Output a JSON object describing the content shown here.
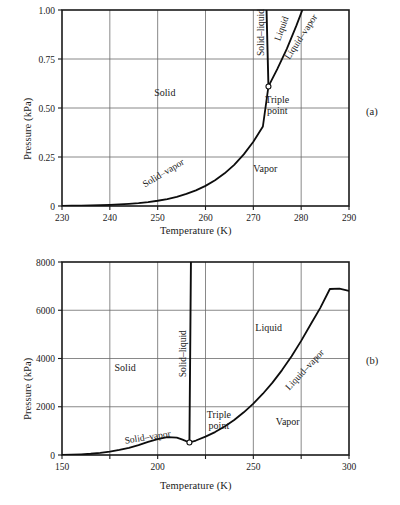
{
  "figure": {
    "panels": [
      {
        "tag": "(a)",
        "chart_data": {
          "type": "line",
          "title": "",
          "xlabel": "Temperature (K)",
          "ylabel": "Pressure (kPa)",
          "xlim": [
            230,
            290
          ],
          "ylim": [
            0,
            1.0
          ],
          "xticks": [
            230,
            240,
            250,
            260,
            270,
            280,
            290
          ],
          "xticklabels": [
            "230",
            "240",
            "250",
            "260",
            "270",
            "280",
            "290"
          ],
          "yticks": [
            0,
            0.25,
            0.5,
            0.75,
            1.0
          ],
          "yticklabels": [
            "0",
            "0.25",
            "0.50",
            "0.75",
            "1.00"
          ],
          "grid": true,
          "legend": "none",
          "annotations": [
            {
              "name": "solid-region-label",
              "text": "Solid",
              "x": 251.5,
              "y": 0.56
            },
            {
              "name": "vapor-region-label",
              "text": "Vapor",
              "x": 272.5,
              "y": 0.175
            },
            {
              "name": "solid-vapor-curve-label",
              "text": "Solid–vapor",
              "x": 251.5,
              "y": 0.155,
              "rotation": -31
            },
            {
              "name": "solid-liquid-curve-label",
              "text": "Solid–liquid",
              "x": 272.2,
              "y": 0.885,
              "rotation": -90
            },
            {
              "name": "liquid-region-label",
              "text": "Liquid",
              "x": 276.5,
              "y": 0.9,
              "rotation": -70
            },
            {
              "name": "liquid-vapor-curve-label",
              "text": "Liquid–vapor",
              "x": 280.5,
              "y": 0.855,
              "rotation": -57
            },
            {
              "name": "triple-point-label",
              "text": "Triple\npoint",
              "x": 275.0,
              "y": 0.525
            }
          ],
          "triple_point": {
            "x": 273.16,
            "y": 0.61
          },
          "series": [
            {
              "name": "solid-vapor sublimation curve",
              "points": [
                [
                  230,
                  0.0009
                ],
                [
                  232,
                  0.0013
                ],
                [
                  234,
                  0.0019
                ],
                [
                  236,
                  0.0028
                ],
                [
                  238,
                  0.004
                ],
                [
                  240,
                  0.0056
                ],
                [
                  242,
                  0.0078
                ],
                [
                  244,
                  0.0108
                ],
                [
                  246,
                  0.0148
                ],
                [
                  248,
                  0.02
                ],
                [
                  250,
                  0.0268
                ],
                [
                  252,
                  0.0356
                ],
                [
                  254,
                  0.047
                ],
                [
                  256,
                  0.0614
                ],
                [
                  258,
                  0.0797
                ],
                [
                  260,
                  0.1026
                ],
                [
                  262,
                  0.1312
                ],
                [
                  264,
                  0.1666
                ],
                [
                  266,
                  0.2101
                ],
                [
                  268,
                  0.2633
                ],
                [
                  270,
                  0.328
                ],
                [
                  272,
                  0.4061
                ],
                [
                  273.16,
                  0.61
                ]
              ]
            },
            {
              "name": "liquid-vapor vaporization curve",
              "points": [
                [
                  273.16,
                  0.61
                ],
                [
                  275,
                  0.698
                ],
                [
                  277,
                  0.802
                ],
                [
                  279,
                  0.92
                ],
                [
                  280.4,
                  1.01
                ]
              ]
            },
            {
              "name": "solid-liquid fusion line",
              "points": [
                [
                  273.16,
                  0.61
                ],
                [
                  272.75,
                  1.01
                ]
              ]
            }
          ]
        }
      },
      {
        "tag": "(b)",
        "chart_data": {
          "type": "line",
          "title": "",
          "xlabel": "Temperature (K)",
          "ylabel": "Pressure (kPa)",
          "xlim": [
            150,
            300
          ],
          "ylim": [
            0,
            8000
          ],
          "xticks": [
            150,
            175,
            200,
            225,
            250,
            275,
            300
          ],
          "xticklabels": [
            "150",
            "",
            "200",
            "",
            "250",
            "",
            "300"
          ],
          "yticks": [
            0,
            2000,
            4000,
            6000,
            8000
          ],
          "yticklabels": [
            "0",
            "2000",
            "4000",
            "6000",
            "8000"
          ],
          "grid": true,
          "legend": "none",
          "annotations": [
            {
              "name": "solid-region-label",
              "text": "Solid",
              "x": 183.0,
              "y": 3500
            },
            {
              "name": "vapor-region-label",
              "text": "Vapor",
              "x": 268.0,
              "y": 1250
            },
            {
              "name": "liquid-region-label",
              "text": "Liquid",
              "x": 258.0,
              "y": 5150
            },
            {
              "name": "solid-vapor-curve-label",
              "text": "Solid–vapor",
              "x": 195.0,
              "y": 620,
              "rotation": -9
            },
            {
              "name": "solid-liquid-curve-label",
              "text": "Solid–liquid",
              "x": 215.0,
              "y": 4200,
              "rotation": -90
            },
            {
              "name": "liquid-vapor-curve-label",
              "text": "Liquid–vapor",
              "x": 278.0,
              "y": 3450,
              "rotation": -47
            },
            {
              "name": "triple-point-label",
              "text": "Triple\npoint",
              "x": 232.0,
              "y": 1550
            }
          ],
          "triple_point": {
            "x": 216.6,
            "y": 518
          },
          "series": [
            {
              "name": "solid-vapor sublimation curve",
              "points": [
                [
                  150,
                  8
                ],
                [
                  155,
                  16
                ],
                [
                  160,
                  30
                ],
                [
                  165,
                  52
                ],
                [
                  170,
                  86
                ],
                [
                  175,
                  138
                ],
                [
                  180,
                  208
                ],
                [
                  185,
                  300
                ],
                [
                  190,
                  412
                ],
                [
                  195,
                  540
                ],
                [
                  200,
                  660
                ],
                [
                  205,
                  740
                ],
                [
                  210,
                  720
                ],
                [
                  213,
                  640
                ],
                [
                  216.6,
                  518
                ]
              ]
            },
            {
              "name": "liquid-vapor vaporization curve",
              "points": [
                [
                  216.6,
                  518
                ],
                [
                  220,
                  600
                ],
                [
                  225,
                  760
                ],
                [
                  230,
                  950
                ],
                [
                  235,
                  1180
                ],
                [
                  240,
                  1450
                ],
                [
                  245,
                  1770
                ],
                [
                  250,
                  2130
                ],
                [
                  255,
                  2540
                ],
                [
                  260,
                  3000
                ],
                [
                  265,
                  3520
                ],
                [
                  270,
                  4090
                ],
                [
                  275,
                  4730
                ],
                [
                  280,
                  5420
                ],
                [
                  285,
                  6100
                ],
                [
                  290,
                  6880
                ],
                [
                  295,
                  6900
                ],
                [
                  300,
                  6800
                ]
              ]
            },
            {
              "name": "solid-liquid fusion line",
              "points": [
                [
                  216.6,
                  518
                ],
                [
                  217.4,
                  8100
                ]
              ]
            }
          ]
        }
      }
    ]
  }
}
